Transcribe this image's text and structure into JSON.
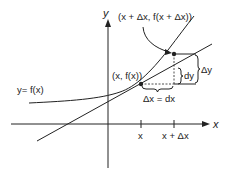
{
  "diagram": {
    "type": "differential-approximation",
    "axis_labels": {
      "x": "x",
      "y": "y"
    },
    "curve_label": "y= f(x)",
    "point_labels": {
      "base": "(x, f(x))",
      "offset": "(x + Δx, f(x + Δx))"
    },
    "tick_labels": [
      "x",
      "x + Δx"
    ],
    "increment_labels": {
      "dx": "Δx = dx",
      "dy": "dy",
      "delta_y": "Δy"
    },
    "colors": {
      "ink": "#222222",
      "background": "#ffffff"
    }
  }
}
